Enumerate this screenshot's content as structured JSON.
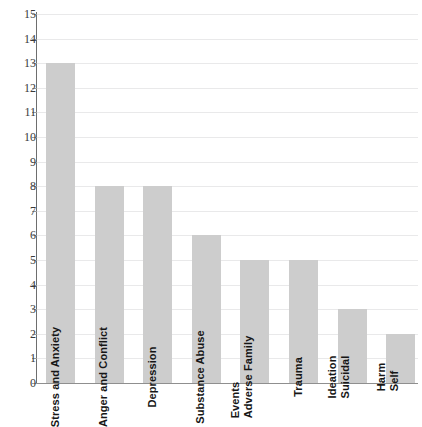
{
  "chart_data": {
    "type": "bar",
    "title": "",
    "subtitle": "",
    "xlabel": "",
    "ylabel": "",
    "ylim": [
      0,
      15
    ],
    "grid": true,
    "legend": false,
    "orientation": "vertical",
    "bar_color": "#cdcdcd",
    "label_placement": "inside-bar-rotated-90",
    "categories": [
      "Stress and Anxiety",
      "Anger and Conflict",
      "Depression",
      "Substance Abuse",
      "Adverse Family Events",
      "Trauma",
      "Suicidal Ideation",
      "Self Harm"
    ],
    "category_label_lines": [
      [
        "Stress and Anxiety"
      ],
      [
        "Anger and Conflict"
      ],
      [
        "Depression"
      ],
      [
        "Substance Abuse"
      ],
      [
        "Adverse Family",
        "Events"
      ],
      [
        "Trauma"
      ],
      [
        "Suicidal",
        "Ideation"
      ],
      [
        "Self",
        "Harm"
      ]
    ],
    "values": [
      13,
      8,
      8,
      6,
      5,
      5,
      3,
      2
    ],
    "ytick_labels": [
      "0",
      "1",
      "2",
      "3",
      "4",
      "5",
      "6",
      "7",
      "8",
      "9",
      "10",
      "11",
      "12",
      "13",
      "14",
      "15"
    ],
    "yticks": [
      0,
      1,
      2,
      3,
      4,
      5,
      6,
      7,
      8,
      9,
      10,
      11,
      12,
      13,
      14,
      15
    ]
  },
  "colors": {
    "bar": "#cdcdcd",
    "gridline": "#e9e9ea",
    "axis": "#6e6e6e",
    "baseline": "#8f8f8f",
    "tick_text": "#3a3a3a",
    "bar_label_text": "#161616",
    "background": "#ffffff"
  }
}
